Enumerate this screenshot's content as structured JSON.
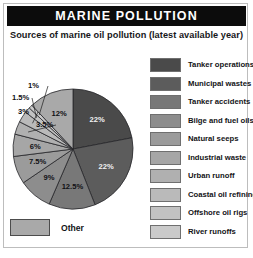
{
  "header": {
    "title": "MARINE POLLUTION"
  },
  "subtitle": "Sources of marine oil pollution (latest available year)",
  "other_key": {
    "label": "Other",
    "color": "#a9a9a9"
  },
  "legend": {
    "items": [
      {
        "label": "Tanker operations",
        "color": "#4a4a4a"
      },
      {
        "label": "Municipal wastes",
        "color": "#5c5c5c"
      },
      {
        "label": "Tanker accidents",
        "color": "#787878"
      },
      {
        "label": "Bilge and fuel oils",
        "color": "#8d8d8d"
      },
      {
        "label": "Natural seeps",
        "color": "#9b9b9b"
      },
      {
        "label": "Industrial waste",
        "color": "#a6a6a6"
      },
      {
        "label": "Urban runoff",
        "color": "#b0b0b0"
      },
      {
        "label": "Coastal oil refining",
        "color": "#bababa"
      },
      {
        "label": "Offshore oil rigs",
        "color": "#c2c2c2"
      },
      {
        "label": "River runoffs",
        "color": "#cacaca"
      }
    ]
  },
  "chart_data": {
    "type": "pie",
    "title": "Sources of marine oil pollution (latest available year)",
    "units": "percent",
    "legend_position": "right",
    "start_angle_deg": 0,
    "direction": "clockwise",
    "categories": [
      "Tanker operations",
      "Municipal wastes",
      "Tanker accidents",
      "Bilge and fuel oils",
      "Natural seeps",
      "Industrial waste",
      "Urban runoff",
      "Coastal oil refining",
      "Offshore oil rigs",
      "River runoffs",
      "Other"
    ],
    "values": [
      22,
      22,
      12.5,
      9,
      7.5,
      6,
      3.5,
      3,
      1.5,
      1,
      12
    ],
    "labels": [
      "22%",
      "22%",
      "12.5%",
      "9%",
      "7.5%",
      "6%",
      "3.5%",
      "3%",
      "1.5%",
      "1%",
      "12%"
    ],
    "colors": [
      "#4a4a4a",
      "#5c5c5c",
      "#787878",
      "#8d8d8d",
      "#9b9b9b",
      "#a6a6a6",
      "#b0b0b0",
      "#bababa",
      "#c2c2c2",
      "#cacaca",
      "#a9a9a9"
    ],
    "leader_line_slices": [
      "Offshore oil rigs",
      "River runoffs"
    ]
  }
}
